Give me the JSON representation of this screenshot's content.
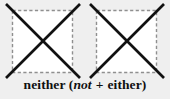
{
  "figure": {
    "type": "crossed-out-dashed-squares-diagram",
    "background_color": "#efefef",
    "caption": {
      "word": "neither",
      "open_paren": "(",
      "term_italic": "not",
      "operator": "+",
      "term_plain": "either",
      "close_paren": ")",
      "full_text": "neither (not + either)",
      "font_style": "bold serif, 'not' italic",
      "text_color": "#101010"
    },
    "shapes": [
      {
        "name": "square-left",
        "style": "dashed",
        "stroke_color": "#8f8f8f",
        "fill_color": "#ffffff",
        "x": 12,
        "y": 10,
        "width": 61,
        "height": 63,
        "crossed_out": true,
        "cross_color": "#111111"
      },
      {
        "name": "square-right",
        "style": "dashed",
        "stroke_color": "#8f8f8f",
        "fill_color": "#ffffff",
        "x": 96,
        "y": 10,
        "width": 61,
        "height": 63,
        "crossed_out": true,
        "cross_color": "#111111"
      }
    ]
  }
}
